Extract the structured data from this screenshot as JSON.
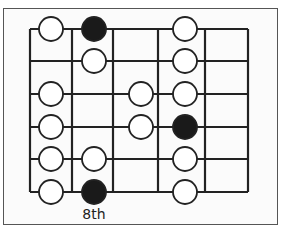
{
  "diagram": {
    "type": "guitar-scale-fretboard",
    "strings": 6,
    "frets_shown": 5,
    "fret_label": "8th",
    "fret_label_column": 1,
    "colors": {
      "line": "#222222",
      "open_note": "#ffffff",
      "root_note": "#1a1a1a",
      "frame": "#555555"
    },
    "grid": {
      "x": [
        30,
        72,
        113,
        158,
        205,
        248
      ],
      "y": [
        29,
        61,
        94,
        127,
        159,
        192
      ]
    },
    "note_columns_x": [
      51,
      94,
      141,
      185
    ],
    "notes": [
      {
        "string": 1,
        "col": 0,
        "root": false
      },
      {
        "string": 1,
        "col": 1,
        "root": true
      },
      {
        "string": 1,
        "col": 3,
        "root": false
      },
      {
        "string": 2,
        "col": 1,
        "root": false
      },
      {
        "string": 2,
        "col": 3,
        "root": false
      },
      {
        "string": 3,
        "col": 0,
        "root": false
      },
      {
        "string": 3,
        "col": 2,
        "root": false
      },
      {
        "string": 3,
        "col": 3,
        "root": false
      },
      {
        "string": 4,
        "col": 0,
        "root": false
      },
      {
        "string": 4,
        "col": 2,
        "root": false
      },
      {
        "string": 4,
        "col": 3,
        "root": true
      },
      {
        "string": 5,
        "col": 0,
        "root": false
      },
      {
        "string": 5,
        "col": 1,
        "root": false
      },
      {
        "string": 5,
        "col": 3,
        "root": false
      },
      {
        "string": 6,
        "col": 0,
        "root": false
      },
      {
        "string": 6,
        "col": 1,
        "root": true
      },
      {
        "string": 6,
        "col": 3,
        "root": false
      }
    ]
  }
}
